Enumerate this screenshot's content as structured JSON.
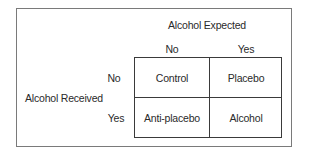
{
  "diagram": {
    "type": "2x2 factorial design",
    "column_factor": {
      "title": "Alcohol Expected",
      "levels": [
        "No",
        "Yes"
      ]
    },
    "row_factor": {
      "title": "Alcohol Received",
      "levels": [
        "No",
        "Yes"
      ]
    },
    "cells": [
      [
        "Control",
        "Placebo"
      ],
      [
        "Anti-placebo",
        "Alcohol"
      ]
    ],
    "colors": {
      "frame_border": "#7a7a7a",
      "grid_lines": "#3a3a3a",
      "text": "#2a2a2a",
      "background": "#ffffff"
    }
  }
}
